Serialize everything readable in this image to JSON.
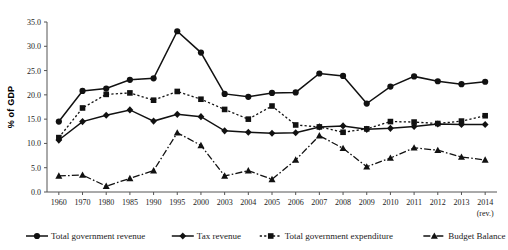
{
  "chart_data": {
    "type": "line",
    "title": "",
    "subtitle": "",
    "xlabel": "",
    "ylabel": "% of GDP",
    "ylim": [
      0,
      35
    ],
    "ytick_step": 5,
    "ytick_labels": [
      "0.0",
      "5.0",
      "10.0",
      "15.0",
      "20.0",
      "25.0",
      "30.0",
      "35.0"
    ],
    "ytick_values": [
      0,
      5,
      10,
      15,
      20,
      25,
      30,
      35
    ],
    "grid": false,
    "legend_position": "bottom",
    "x_axis_note": "(rev.)",
    "categories": [
      "1960",
      "1970",
      "1980",
      "1985",
      "1990",
      "1995",
      "2000",
      "2003",
      "2004",
      "2005",
      "2006",
      "2007",
      "2008",
      "2009",
      "2010",
      "2011",
      "2012",
      "2013",
      "2014"
    ],
    "series": [
      {
        "name": "Total government revenue",
        "marker": "circle",
        "dash": "solid",
        "values": [
          14.5,
          20.8,
          21.3,
          23.1,
          23.4,
          33.1,
          28.7,
          20.2,
          19.6,
          20.4,
          20.5,
          24.4,
          23.9,
          18.2,
          21.7,
          23.8,
          22.8,
          22.2,
          22.7
        ]
      },
      {
        "name": "Tax revenue",
        "marker": "diamond",
        "dash": "solid",
        "values": [
          10.7,
          14.5,
          15.8,
          16.9,
          14.6,
          16.0,
          15.5,
          12.6,
          12.3,
          12.1,
          12.2,
          13.4,
          13.6,
          12.9,
          13.1,
          13.5,
          14.0,
          13.9,
          13.9
        ]
      },
      {
        "name": "Total government expenditure",
        "marker": "square",
        "dash": "dotted",
        "values": [
          11.2,
          17.3,
          20.1,
          20.4,
          18.9,
          20.7,
          19.1,
          17.0,
          15.0,
          17.7,
          13.8,
          13.4,
          12.3,
          13.0,
          14.5,
          14.4,
          14.1,
          14.6,
          15.7
        ]
      },
      {
        "name": "Budget Balance",
        "marker": "triangle",
        "dash": "dashdot",
        "values": [
          3.3,
          3.5,
          1.2,
          2.8,
          4.4,
          12.2,
          9.6,
          3.3,
          4.4,
          2.6,
          6.6,
          11.6,
          9.0,
          5.2,
          7.0,
          9.1,
          8.6,
          7.2,
          6.6
        ]
      }
    ]
  },
  "colors": {
    "ink": "#111111",
    "axis": "#555555",
    "background": "#ffffff"
  }
}
